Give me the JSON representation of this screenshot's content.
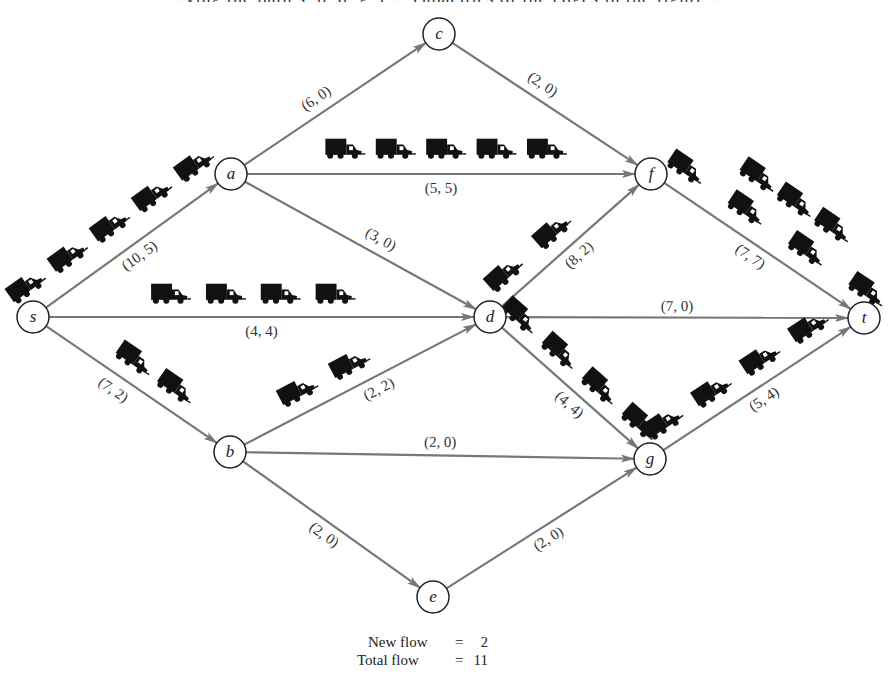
{
  "header": {
    "partial_top_text": "...ying the path s, b, d, g, t ... capacities of the edges in the figure..."
  },
  "graph": {
    "node_radius": 16,
    "nodes": [
      {
        "id": "s",
        "label": "s",
        "x": 33,
        "y": 317
      },
      {
        "id": "a",
        "label": "a",
        "x": 231,
        "y": 174
      },
      {
        "id": "c",
        "label": "c",
        "x": 439,
        "y": 34
      },
      {
        "id": "f",
        "label": "f",
        "x": 651,
        "y": 174
      },
      {
        "id": "d",
        "label": "d",
        "x": 490,
        "y": 317
      },
      {
        "id": "t",
        "label": "t",
        "x": 864,
        "y": 318
      },
      {
        "id": "b",
        "label": "b",
        "x": 230,
        "y": 452
      },
      {
        "id": "g",
        "label": "g",
        "x": 650,
        "y": 459
      },
      {
        "id": "e",
        "label": "e",
        "x": 433,
        "y": 597
      }
    ],
    "edges": [
      {
        "from": "s",
        "to": "a",
        "capacity": 10,
        "flow": 5,
        "label": "(10, 5)",
        "label_side": "below",
        "label_offset": 14,
        "label_t": 0.5,
        "trucks": 5,
        "truck_side": "above",
        "truck_offset": 26,
        "truck_start": 0.05,
        "truck_end": 0.9
      },
      {
        "from": "s",
        "to": "d",
        "capacity": 4,
        "flow": 4,
        "label": "(4, 4)",
        "label_side": "below",
        "label_offset": 16,
        "label_t": 0.5,
        "trucks": 4,
        "truck_side": "above",
        "truck_offset": 20,
        "truck_start": 0.3,
        "truck_end": 0.66
      },
      {
        "from": "s",
        "to": "b",
        "capacity": 7,
        "flow": 2,
        "label": "(7, 2)",
        "label_side": "below",
        "label_offset": 16,
        "label_t": 0.45,
        "trucks": 2,
        "truck_side": "above",
        "truck_offset": 20,
        "truck_start": 0.45,
        "truck_end": 0.66
      },
      {
        "from": "a",
        "to": "c",
        "capacity": 6,
        "flow": 0,
        "label": "(6, 0)",
        "label_side": "above",
        "label_offset": 14,
        "label_t": 0.45,
        "trucks": 0
      },
      {
        "from": "a",
        "to": "f",
        "capacity": 5,
        "flow": 5,
        "label": "(5, 5)",
        "label_side": "below",
        "label_offset": 16,
        "label_t": 0.5,
        "trucks": 5,
        "truck_side": "above",
        "truck_offset": 22,
        "truck_start": 0.27,
        "truck_end": 0.75
      },
      {
        "from": "a",
        "to": "d",
        "capacity": 3,
        "flow": 0,
        "label": "(3, 0)",
        "label_side": "above",
        "label_offset": 14,
        "label_t": 0.55,
        "trucks": 0
      },
      {
        "from": "c",
        "to": "f",
        "capacity": 2,
        "flow": 0,
        "label": "(2, 0)",
        "label_side": "above",
        "label_offset": 14,
        "label_t": 0.45,
        "trucks": 0
      },
      {
        "from": "d",
        "to": "f",
        "capacity": 8,
        "flow": 2,
        "label": "(8, 2)",
        "label_side": "below",
        "label_offset": 14,
        "label_t": 0.5,
        "trucks": 2,
        "truck_side": "above",
        "truck_offset": 20,
        "truck_start": 0.18,
        "truck_end": 0.48
      },
      {
        "from": "d",
        "to": "t",
        "capacity": 7,
        "flow": 0,
        "label": "(7, 0)",
        "label_side": "above",
        "label_offset": 10,
        "label_t": 0.5,
        "trucks": 0
      },
      {
        "from": "d",
        "to": "g",
        "capacity": 4,
        "flow": 4,
        "label": "(4, 4)",
        "label_side": "below",
        "label_offset": 14,
        "label_t": 0.55,
        "trucks": 4,
        "truck_side": "above",
        "truck_offset": 18,
        "truck_start": 0.1,
        "truck_end": 0.85
      },
      {
        "from": "f",
        "to": "t",
        "capacity": 7,
        "flow": 7,
        "label": "(7, 7)",
        "label_side": "below",
        "label_offset": 14,
        "label_t": 0.5,
        "trucks": 7,
        "truck_side": "above",
        "truck_offset": 22,
        "truck_start": 0.08,
        "truck_end": 0.92,
        "truck_double_row": true
      },
      {
        "from": "b",
        "to": "d",
        "capacity": 2,
        "flow": 2,
        "label": "(2, 2)",
        "label_side": "below",
        "label_offset": 14,
        "label_t": 0.55,
        "trucks": 2,
        "truck_side": "above",
        "truck_offset": 20,
        "truck_start": 0.3,
        "truck_end": 0.5
      },
      {
        "from": "b",
        "to": "g",
        "capacity": 2,
        "flow": 0,
        "label": "(2, 0)",
        "label_side": "above",
        "label_offset": 12,
        "label_t": 0.5,
        "trucks": 0
      },
      {
        "from": "b",
        "to": "e",
        "capacity": 2,
        "flow": 0,
        "label": "(2, 0)",
        "label_side": "below",
        "label_offset": 14,
        "label_t": 0.5,
        "trucks": 0
      },
      {
        "from": "e",
        "to": "g",
        "capacity": 2,
        "flow": 0,
        "label": "(2, 0)",
        "label_side": "below",
        "label_offset": 14,
        "label_t": 0.5,
        "trucks": 0
      },
      {
        "from": "g",
        "to": "t",
        "capacity": 5,
        "flow": 4,
        "label": "(5, 4)",
        "label_side": "below",
        "label_offset": 14,
        "label_t": 0.5,
        "trucks": 4,
        "truck_side": "above",
        "truck_offset": 20,
        "truck_start": 0.12,
        "truck_end": 0.8
      }
    ],
    "colors": {
      "edge": "#777777",
      "node_stroke": "#222222",
      "node_fill": "#ffffff",
      "label": "#333333",
      "truck": "#111111"
    }
  },
  "caption": {
    "new_flow_label": "New flow",
    "new_flow_eq": "=",
    "new_flow_value": "2",
    "total_flow_label": "Total flow",
    "total_flow_eq": "=",
    "total_flow_value": "11"
  }
}
